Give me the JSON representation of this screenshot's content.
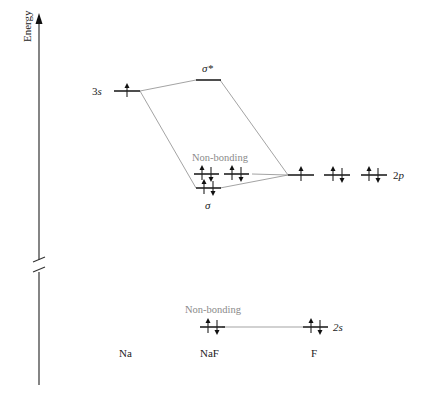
{
  "diagram": {
    "type": "molecular-orbital-diagram",
    "axis": {
      "label": "Energy",
      "has_break": true
    },
    "columns": [
      {
        "id": "na",
        "label": "Na"
      },
      {
        "id": "naf",
        "label": "NaF"
      },
      {
        "id": "f",
        "label": "F"
      }
    ],
    "levels": {
      "na_3s": {
        "label": "3s",
        "electrons": "up"
      },
      "sigma_star": {
        "label": "σ*",
        "electrons": "empty"
      },
      "sigma": {
        "label": "σ",
        "electrons": "up-down"
      },
      "nonbonding_2p": {
        "label": "Non-bonding",
        "count": 2,
        "electrons": "up-down"
      },
      "f_2p": {
        "label": "2p",
        "orbitals": [
          "up",
          "up-down",
          "up-down"
        ]
      },
      "nonbonding_2s": {
        "label": "Non-bonding",
        "electrons": "up-down"
      },
      "f_2s": {
        "label": "2s",
        "electrons": "up-down"
      }
    }
  },
  "text": {
    "energy": "Energy",
    "na_3s": "3s",
    "sigma_star": "σ*",
    "sigma": "σ",
    "nonbonding_upper": "Non-bonding",
    "nonbonding_lower": "Non-bonding",
    "f_2p": "2p",
    "f_2s": "2s",
    "col_na": "Na",
    "col_naf": "NaF",
    "col_f": "F"
  }
}
